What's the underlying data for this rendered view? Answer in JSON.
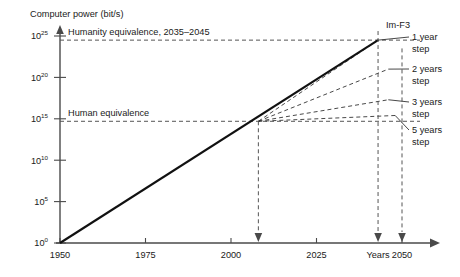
{
  "chart_data": {
    "type": "line",
    "title": "",
    "ylabel": "Computer power (bit/s)",
    "xlabel": "Years",
    "series_label": "Im-F3",
    "xlim": [
      1950,
      2053
    ],
    "ylim_exponent": [
      0,
      26
    ],
    "xticks": [
      1950,
      1975,
      2000,
      2025,
      2050
    ],
    "xtick_labels": [
      "1950",
      "1975",
      "2000",
      "2025",
      "2050"
    ],
    "yticks_exponent": [
      0,
      5,
      10,
      15,
      20,
      25
    ],
    "ytick_mantissa": "10",
    "ytick_labels": [
      "10^0",
      "10^5",
      "10^10",
      "10^15",
      "10^20",
      "10^25"
    ],
    "ytick_exponents": [
      "0",
      "5",
      "10",
      "15",
      "20",
      "25"
    ],
    "grid": false,
    "legend_position": "right",
    "reference_lines": [
      {
        "name": "humanity-equivalence",
        "label": "Humanity equivalence, 2035–2045",
        "y_exponent": 24.5,
        "style": "dashed"
      },
      {
        "name": "human-equivalence",
        "label": "Human equivalence",
        "y_exponent": 14.7,
        "style": "dashed"
      }
    ],
    "main_trend": {
      "name": "moore-law-main",
      "label": "Im-F3",
      "points": [
        [
          1950,
          0
        ],
        [
          2043,
          24.5
        ]
      ],
      "style": "solid-thick"
    },
    "fan_origin": [
      2008,
      14.7
    ],
    "fan_branches": [
      {
        "name": "1-year-step",
        "label": "1 year step",
        "step_years": 1,
        "end_year": 2043,
        "end_exponent": 24.5
      },
      {
        "name": "2-years-step",
        "label": "2 years step",
        "step_years": 2,
        "end_year": 2046,
        "end_exponent": 21.0
      },
      {
        "name": "3-years-step",
        "label": "3 years step",
        "step_years": 3,
        "end_year": 2046,
        "end_exponent": 17.3
      },
      {
        "name": "5-years-step",
        "label": "5 years step",
        "step_years": 5,
        "end_year": 2048,
        "end_exponent": 15.4
      }
    ],
    "legend_entries": [
      {
        "line1": "1 year",
        "line2": "step"
      },
      {
        "line1": "2 years",
        "line2": "step"
      },
      {
        "line1": "3 years",
        "line2": "step"
      },
      {
        "line1": "5 years",
        "line2": "step"
      }
    ],
    "annotation_arrows": [
      {
        "name": "arrow-2008",
        "year": 2008,
        "label": ""
      },
      {
        "name": "arrow-years",
        "year": 2043,
        "label": "Years"
      },
      {
        "name": "arrow-2050",
        "year": 2050,
        "label": "2050"
      }
    ],
    "xaxis_caption": "Years"
  }
}
